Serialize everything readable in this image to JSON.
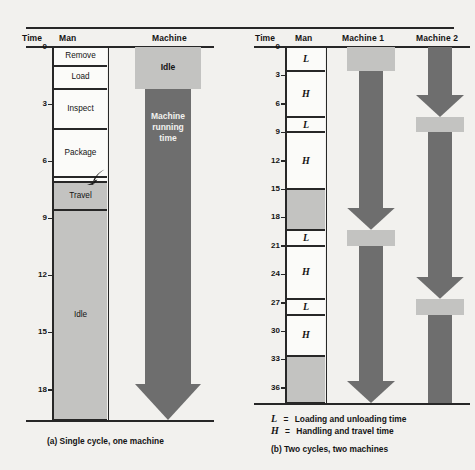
{
  "figure": {
    "background": "#f2f1ee",
    "ink": "#272727",
    "light_gray": "#c3c3c1",
    "dark_gray": "#6e6e6e",
    "white_fill": "#fbfbf9"
  },
  "panel_a": {
    "caption": "(a) Single cycle, one machine",
    "headers": {
      "time": "Time",
      "man": "Man",
      "machine": "Machine"
    },
    "axis": {
      "ticks": [
        "0",
        "3",
        "6",
        "9",
        "12",
        "15",
        "18"
      ],
      "min": 0,
      "max": 19.6
    },
    "man_segments": [
      {
        "label": "Remove",
        "start": 0,
        "end": 1.0,
        "fill": "white"
      },
      {
        "label": "Load",
        "start": 1.0,
        "end": 2.2,
        "fill": "white"
      },
      {
        "label": "Inspect",
        "start": 2.2,
        "end": 4.3,
        "fill": "white"
      },
      {
        "label": "Package",
        "start": 4.3,
        "end": 6.85,
        "fill": "white"
      },
      {
        "label": "",
        "start": 6.85,
        "end": 7.1,
        "fill": "white"
      },
      {
        "label": "Travel",
        "start": 7.1,
        "end": 8.55,
        "fill": "gray"
      },
      {
        "label": "Idle",
        "start": 8.55,
        "end": 19.6,
        "fill": "gray"
      }
    ],
    "machine_blocks": [
      {
        "label": "Idle",
        "start": 0,
        "end": 2.2,
        "tone": "light",
        "arrow": false
      },
      {
        "label": "Machine\nrunning\ntime",
        "start": 2.2,
        "end": 19.6,
        "tone": "dark",
        "arrow": true
      }
    ]
  },
  "panel_b": {
    "caption": "(b) Two cycles, two machines",
    "headers": {
      "time": "Time",
      "man": "Man",
      "machine1": "Machine 1",
      "machine2": "Machine 2"
    },
    "axis": {
      "ticks": [
        "0",
        "3",
        "6",
        "9",
        "12",
        "15",
        "18",
        "21",
        "24",
        "27",
        "30",
        "33",
        "36"
      ],
      "min": 0,
      "max": 37.6
    },
    "legend": [
      {
        "symbol": "L",
        "eq": "=",
        "text": "Loading and unloading time"
      },
      {
        "symbol": "H",
        "eq": "=",
        "text": "Handling and travel time"
      }
    ],
    "man_segments": [
      {
        "label": "L",
        "start": 0,
        "end": 2.5,
        "fill": "white"
      },
      {
        "label": "H",
        "start": 2.5,
        "end": 7.4,
        "fill": "white"
      },
      {
        "label": "L",
        "start": 7.4,
        "end": 9.0,
        "fill": "white"
      },
      {
        "label": "H",
        "start": 9.0,
        "end": 15.0,
        "fill": "white"
      },
      {
        "label": "",
        "start": 15.0,
        "end": 19.3,
        "fill": "gray"
      },
      {
        "label": "L",
        "start": 19.3,
        "end": 21.0,
        "fill": "white"
      },
      {
        "label": "H",
        "start": 21.0,
        "end": 26.6,
        "fill": "white"
      },
      {
        "label": "L",
        "start": 26.6,
        "end": 28.3,
        "fill": "white"
      },
      {
        "label": "H",
        "start": 28.3,
        "end": 32.6,
        "fill": "white"
      },
      {
        "label": "",
        "start": 32.6,
        "end": 37.6,
        "fill": "gray"
      }
    ],
    "machine1_blocks": [
      {
        "start": 0,
        "end": 2.5,
        "tone": "light",
        "arrow": false
      },
      {
        "start": 2.5,
        "end": 19.3,
        "tone": "dark",
        "arrow": true
      },
      {
        "start": 19.3,
        "end": 21.0,
        "tone": "light",
        "arrow": false
      },
      {
        "start": 21.0,
        "end": 37.6,
        "tone": "dark",
        "arrow": true
      }
    ],
    "machine2_blocks": [
      {
        "start": 0,
        "end": 7.4,
        "tone": "dark",
        "arrow": true
      },
      {
        "start": 7.4,
        "end": 9.0,
        "tone": "light",
        "arrow": false
      },
      {
        "start": 9.0,
        "end": 26.6,
        "tone": "dark",
        "arrow": true
      },
      {
        "start": 26.6,
        "end": 28.3,
        "tone": "light",
        "arrow": false
      },
      {
        "start": 28.3,
        "end": 37.6,
        "tone": "dark",
        "arrow": false
      }
    ]
  }
}
